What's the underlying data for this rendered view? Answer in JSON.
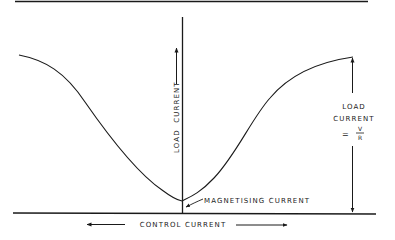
{
  "diagram": {
    "title": "",
    "labels": {
      "y_axis": "LOAD  CURRENT",
      "x_axis": "CONTROL CURRENT",
      "minimum": "MAGNETISING CURRENT",
      "right_annotation_line1": "LOAD",
      "right_annotation_line2": "CURRENT",
      "right_annotation_eq": "=",
      "right_annotation_num": "V",
      "right_annotation_den": "R"
    },
    "colors": {
      "ink": "#1a1a1a",
      "background": "#ffffff"
    }
  }
}
